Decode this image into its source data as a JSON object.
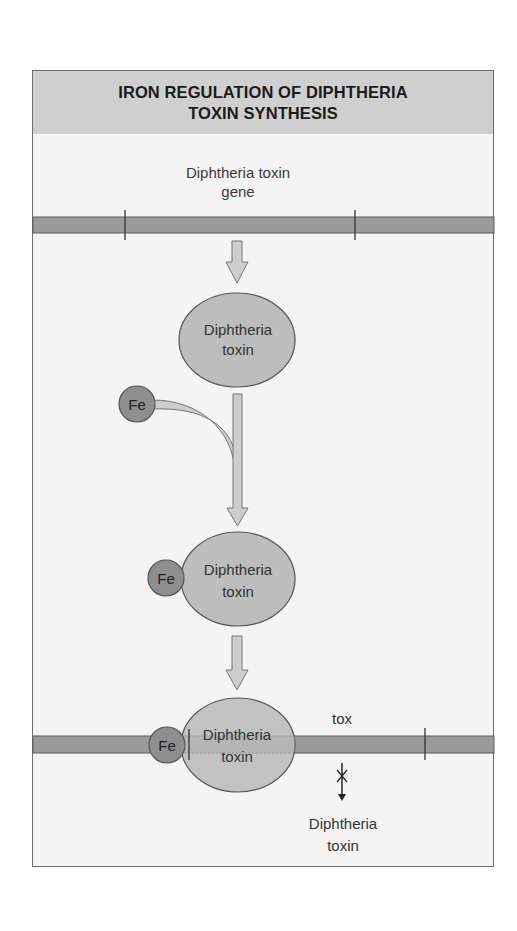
{
  "title": "IRON REGULATION OF DIPHTHERIA TOXIN SYNTHESIS",
  "labels": {
    "gene_line1": "Diphtheria toxin",
    "gene_line2": "gene",
    "protein_line1": "Diphtheria",
    "protein_line2": "toxin",
    "iron": "Fe",
    "tox": "tox",
    "product_line1": "Diphtheria",
    "product_line2": "toxin"
  },
  "colors": {
    "header_bg": "#cfcfcf",
    "panel_bg": "#f4f4f4",
    "dna_bar": "#9a9a9a",
    "toxin_fill": "#bdbdbd",
    "iron_fill": "#8e8e8e",
    "arrow_fill": "#cdcdcd"
  }
}
